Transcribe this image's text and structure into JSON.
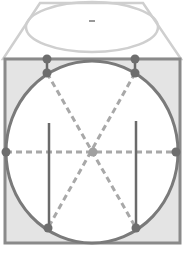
{
  "diagram": {
    "colors": {
      "background": "#ffffff",
      "face_fill": "#e4e4e4",
      "face_stroke": "#8a8a8a",
      "top_stroke": "#cfcfcf",
      "circle_stroke": "#7a7a7a",
      "circle_fill": "#ffffff",
      "dash_stroke": "#a8a8a8",
      "dot_fill": "#6e6e6e",
      "center_dot_fill": "#a0a0a0",
      "vertical_line": "#6a6a6a"
    },
    "top_face": {
      "points": [
        [
          40,
          3
        ],
        [
          143,
          3
        ],
        [
          181,
          59
        ],
        [
          3,
          59
        ]
      ]
    },
    "top_ellipse": {
      "cx": 92,
      "cy": 27,
      "rx": 66,
      "ry": 25
    },
    "top_center_mark": {
      "x1": 89,
      "y1": 21,
      "x2": 95,
      "y2": 21
    },
    "front_face": {
      "x": 5,
      "y": 59,
      "width": 175,
      "height": 184
    },
    "circle": {
      "cx": 92,
      "cy": 152,
      "rx": 86,
      "ry": 91
    },
    "dashed_lines": [
      {
        "x1": 6,
        "y1": 152,
        "x2": 176,
        "y2": 152
      },
      {
        "x1": 47,
        "y1": 73,
        "x2": 136,
        "y2": 228
      },
      {
        "x1": 135,
        "y1": 73,
        "x2": 48,
        "y2": 228
      }
    ],
    "vertical_lines": [
      {
        "x1": 49,
        "y1": 123,
        "x2": 49,
        "y2": 228
      },
      {
        "x1": 136,
        "y1": 121,
        "x2": 136,
        "y2": 228
      },
      {
        "x1": 47,
        "y1": 59,
        "x2": 47,
        "y2": 73
      },
      {
        "x1": 135,
        "y1": 59,
        "x2": 135,
        "y2": 73
      }
    ],
    "dots": [
      {
        "cx": 47,
        "cy": 59
      },
      {
        "cx": 135,
        "cy": 59
      },
      {
        "cx": 47,
        "cy": 73
      },
      {
        "cx": 135,
        "cy": 73
      },
      {
        "cx": 6,
        "cy": 152
      },
      {
        "cx": 176,
        "cy": 152
      },
      {
        "cx": 48,
        "cy": 228
      },
      {
        "cx": 136,
        "cy": 228
      }
    ],
    "center_dot": {
      "cx": 93,
      "cy": 152
    }
  }
}
